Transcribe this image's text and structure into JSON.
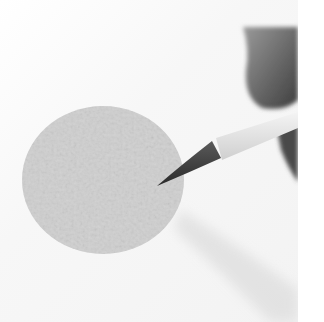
{
  "image": {
    "description": "Grayscale photo of a paintbrush painting a textured gray circle on white paper, with a hand at the top right",
    "colors": {
      "background": "#ffffff",
      "paper": "#f5f5f5",
      "circle": "#cfcfcf",
      "brush_tip": "#3a3a3a",
      "brush_handle": "#ececec",
      "hand": "#6e6e6e",
      "shadow": "#e2e2e2"
    }
  }
}
